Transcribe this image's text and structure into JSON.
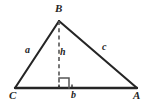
{
  "figure": {
    "kind": "geometry-diagram",
    "background_color": "#ffffff",
    "stroke_color": "#252525",
    "label_color": "#252525",
    "width": 147,
    "height": 104
  },
  "vertices": [
    {
      "id": "B",
      "label": "B",
      "x": 59,
      "y": 21
    },
    {
      "id": "C",
      "label": "C",
      "x": 15,
      "y": 88
    },
    {
      "id": "A",
      "label": "A",
      "x": 137,
      "y": 88
    }
  ],
  "sides": [
    {
      "id": "a",
      "label": "a",
      "from": "C",
      "to": "B"
    },
    {
      "id": "c",
      "label": "c",
      "from": "B",
      "to": "A"
    },
    {
      "id": "b",
      "label": "b",
      "from": "C",
      "to": "A"
    }
  ],
  "altitude": {
    "id": "h",
    "label": "h",
    "from": "B",
    "foot_x": 59,
    "foot_y": 88,
    "style": "dashed",
    "right_angle_marker": true
  },
  "markers": {
    "right_angle": {
      "x": 59,
      "y": 78,
      "size": 10
    },
    "base_ticks": [
      {
        "x": 59,
        "y": 86
      },
      {
        "x": 72,
        "y": 86
      }
    ]
  }
}
